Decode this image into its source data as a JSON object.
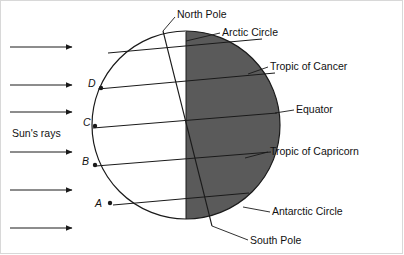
{
  "diagram": {
    "colors": {
      "night_fill": "#5a5a5a",
      "day_fill": "#ffffff",
      "stroke": "#1a1a1a",
      "frame": "#d8d8d8",
      "text": "#111111"
    },
    "globe": {
      "cx": 186,
      "cy": 125,
      "r": 94,
      "terminator_x": 186
    },
    "labels": [
      {
        "id": "north-pole",
        "text": "North Pole",
        "x": 177,
        "y": 9,
        "leader": [
          [
            175,
            17
          ],
          [
            163,
            31
          ]
        ]
      },
      {
        "id": "arctic-circle",
        "text": "Arctic Circle",
        "x": 222,
        "y": 27,
        "leader": [
          [
            220,
            33
          ],
          [
            186,
            41
          ]
        ]
      },
      {
        "id": "tropic-of-cancer",
        "text": "Tropic of Cancer",
        "x": 270,
        "y": 61,
        "leader": [
          [
            268,
            67
          ],
          [
            248,
            74
          ]
        ]
      },
      {
        "id": "equator",
        "text": "Equator",
        "x": 296,
        "y": 104,
        "leader": [
          [
            294,
            110
          ],
          [
            275,
            113
          ]
        ]
      },
      {
        "id": "tropic-of-capricorn",
        "text": "Tropic of Capricorn",
        "x": 270,
        "y": 146,
        "leader": [
          [
            268,
            152
          ],
          [
            245,
            158
          ]
        ]
      },
      {
        "id": "antarctic-circle",
        "text": "Antarctic Circle",
        "x": 272,
        "y": 206,
        "leader": [
          [
            270,
            212
          ],
          [
            243,
            207
          ]
        ]
      },
      {
        "id": "south-pole",
        "text": "South Pole",
        "x": 250,
        "y": 235,
        "leader": [
          [
            248,
            240
          ],
          [
            212,
            226
          ]
        ]
      }
    ],
    "points": [
      {
        "id": "point-d",
        "label": "D",
        "lx": 88,
        "ly": 78,
        "px": 101,
        "py": 88
      },
      {
        "id": "point-c",
        "label": "C",
        "lx": 83,
        "ly": 117,
        "px": 95,
        "py": 126
      },
      {
        "id": "point-b",
        "label": "B",
        "lx": 82,
        "ly": 156,
        "px": 95,
        "py": 165
      },
      {
        "id": "point-a",
        "label": "A",
        "lx": 95,
        "ly": 198,
        "px": 110,
        "py": 203
      }
    ],
    "sun_rays": {
      "label": "Sun's rays",
      "label_x": 12,
      "label_y": 128,
      "arrows_y": [
        47,
        85,
        112,
        152,
        190,
        228
      ],
      "x_start": 10,
      "x_end": 72
    },
    "latitude_lines": [
      {
        "id": "arctic-circle-line",
        "x1": 108,
        "y1": 53,
        "x2": 262,
        "y2": 39
      },
      {
        "id": "tropic-of-cancer-line",
        "x1": 98,
        "y1": 89,
        "x2": 275,
        "y2": 73
      },
      {
        "id": "equator-line",
        "x1": 93,
        "y1": 128,
        "x2": 277,
        "y2": 113
      },
      {
        "id": "tropic-of-capricorn-line",
        "x1": 96,
        "y1": 166,
        "x2": 271,
        "y2": 152
      },
      {
        "id": "antarctic-circle-line",
        "x1": 113,
        "y1": 205,
        "x2": 249,
        "y2": 193
      }
    ],
    "axis": {
      "x1": 163,
      "y1": 31,
      "x2": 212,
      "y2": 226
    },
    "terminator": {
      "x": 186,
      "y_top": 32,
      "y_bottom": 219
    }
  }
}
